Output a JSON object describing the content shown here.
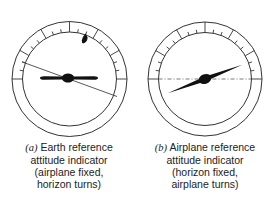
{
  "figure": {
    "panels": [
      {
        "id": "a",
        "label": "(a)",
        "caption_lines": [
          "Earth reference",
          "attitude indicator",
          "(airplane fixed,",
          "horizon turns)"
        ],
        "center": [
          69.5,
          79
        ],
        "outer_radius": 57.5,
        "inner_radius": 47,
        "horizon_style": "solid",
        "horizon_angle_deg": 20,
        "airplane_angle_deg": 0,
        "bank_pointer_angle_deg": 20
      },
      {
        "id": "b",
        "label": "(b)",
        "caption_lines": [
          "Airplane reference",
          "attitude indicator",
          "(horizon fixed,",
          "airplane turns)"
        ],
        "center": [
          205,
          79
        ],
        "outer_radius": 57,
        "inner_radius": 46.5,
        "horizon_style": "dash-dot",
        "horizon_angle_deg": 0,
        "airplane_angle_deg": -20
      }
    ],
    "scale_ticks": {
      "major_deg": [
        -90,
        -60,
        -30,
        0,
        30,
        60,
        90
      ],
      "minor_deg": [
        -80,
        -70,
        -50,
        -40,
        -20,
        -10,
        10,
        20,
        40,
        50,
        70,
        80
      ]
    },
    "colors": {
      "ink": "#1a1a1a",
      "line": "#333333",
      "background": "#ffffff"
    }
  }
}
